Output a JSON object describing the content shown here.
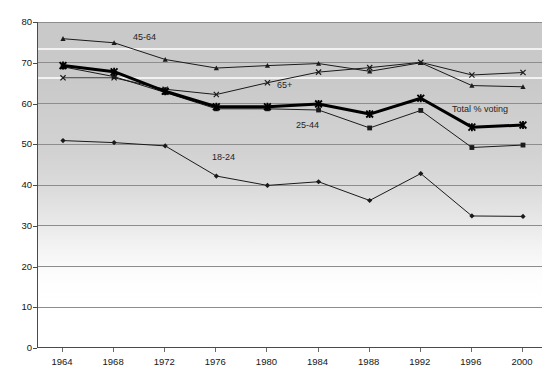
{
  "chart_data": {
    "type": "line",
    "title": "",
    "xlabel": "",
    "ylabel": "",
    "categories": [
      1964,
      1968,
      1972,
      1976,
      1980,
      1984,
      1988,
      1992,
      1996,
      2000
    ],
    "x_tick_labels": [
      "1964",
      "1968",
      "1972",
      "1976",
      "1980",
      "1984",
      "1988",
      "1992",
      "1996",
      "2000"
    ],
    "y_tick_labels": [
      "0",
      "10",
      "20",
      "30",
      "40",
      "50",
      "60",
      "70",
      "80"
    ],
    "y_ticks": [
      0,
      10,
      20,
      30,
      40,
      50,
      60,
      70,
      80
    ],
    "ylim": [
      0,
      80
    ],
    "grid": true,
    "legend": "inline-annotations",
    "series": [
      {
        "name": "45-64",
        "marker": "triangle",
        "color": "#1a1a1a",
        "width": 1,
        "annotation": "45-64",
        "values": [
          75.9,
          74.9,
          70.8,
          68.7,
          69.3,
          69.8,
          67.9,
          70.0,
          64.4,
          64.1
        ]
      },
      {
        "name": "65+",
        "marker": "x",
        "color": "#1a1a1a",
        "width": 1,
        "annotation": "65+",
        "values": [
          66.3,
          66.3,
          63.5,
          62.2,
          65.1,
          67.7,
          68.8,
          70.1,
          67.0,
          67.6
        ]
      },
      {
        "name": "25-44",
        "marker": "square",
        "color": "#1a1a1a",
        "width": 1,
        "annotation": "25-44",
        "values": [
          69.0,
          66.6,
          62.7,
          58.7,
          58.7,
          58.4,
          54.0,
          58.3,
          49.2,
          49.8
        ]
      },
      {
        "name": "18-24",
        "marker": "diamond",
        "color": "#1a1a1a",
        "width": 1,
        "annotation": "18-24",
        "values": [
          50.9,
          50.4,
          49.6,
          42.2,
          39.9,
          40.8,
          36.2,
          42.8,
          32.4,
          32.3
        ]
      },
      {
        "name": "Total % voting",
        "marker": "star",
        "color": "#000000",
        "width": 3,
        "annotation": "Total %  voting",
        "values": [
          69.3,
          67.8,
          63.0,
          59.2,
          59.2,
          59.9,
          57.4,
          61.3,
          54.2,
          54.7
        ]
      }
    ],
    "annotations": [
      {
        "text": "45-64",
        "x": 133,
        "y": 32
      },
      {
        "text": "65+",
        "x": 277,
        "y": 80
      },
      {
        "text": "25-44",
        "x": 296,
        "y": 120
      },
      {
        "text": "18-24",
        "x": 212,
        "y": 152
      },
      {
        "text": "Total %  voting",
        "x": 452,
        "y": 104
      }
    ]
  }
}
